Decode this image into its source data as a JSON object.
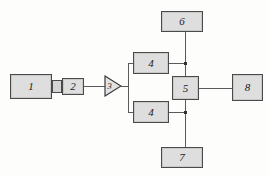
{
  "diagram": {
    "background_color": "#fdfdfc",
    "block_fill_color": "#dedede",
    "block_border_color": "#4a4a4a",
    "wire_color": "#5a5a5a",
    "blocks": [
      {
        "id": "block-1",
        "label": "1",
        "x": 10,
        "y": 74,
        "w": 42,
        "h": 25
      },
      {
        "id": "block-2",
        "label": "2",
        "x": 62,
        "y": 78,
        "w": 22,
        "h": 17
      },
      {
        "id": "block-4-top",
        "label": "4",
        "x": 133,
        "y": 52,
        "w": 36,
        "h": 22
      },
      {
        "id": "block-4-bottom",
        "label": "4",
        "x": 133,
        "y": 101,
        "w": 36,
        "h": 22
      },
      {
        "id": "block-5",
        "label": "5",
        "x": 172,
        "y": 76,
        "w": 27,
        "h": 24
      },
      {
        "id": "block-6",
        "label": "6",
        "x": 161,
        "y": 11,
        "w": 42,
        "h": 21
      },
      {
        "id": "block-7",
        "label": "7",
        "x": 161,
        "y": 147,
        "w": 42,
        "h": 21
      },
      {
        "id": "block-8",
        "label": "8",
        "x": 232,
        "y": 74,
        "w": 31,
        "h": 27
      }
    ],
    "amplifier": {
      "id": "block-3",
      "label": "3",
      "x": 104,
      "y": 74,
      "w": 18,
      "h": 22
    },
    "coupler": {
      "id": "coupler-nub",
      "x": 52,
      "y": 80,
      "w": 10,
      "h": 13
    },
    "connections": [
      {
        "from": "block-2",
        "to": "block-3",
        "type": "horizontal"
      },
      {
        "from": "block-3",
        "to": "block-4-top",
        "type": "branch-up"
      },
      {
        "from": "block-3",
        "to": "block-4-bottom",
        "type": "branch-down"
      },
      {
        "from": "block-4-top",
        "to": "block-5",
        "type": "horizontal-junction"
      },
      {
        "from": "block-4-bottom",
        "to": "block-5",
        "type": "horizontal-junction"
      },
      {
        "from": "block-6",
        "to": "block-5",
        "type": "vertical"
      },
      {
        "from": "block-5",
        "to": "block-7",
        "type": "vertical"
      },
      {
        "from": "block-5",
        "to": "block-8",
        "type": "horizontal"
      }
    ]
  }
}
